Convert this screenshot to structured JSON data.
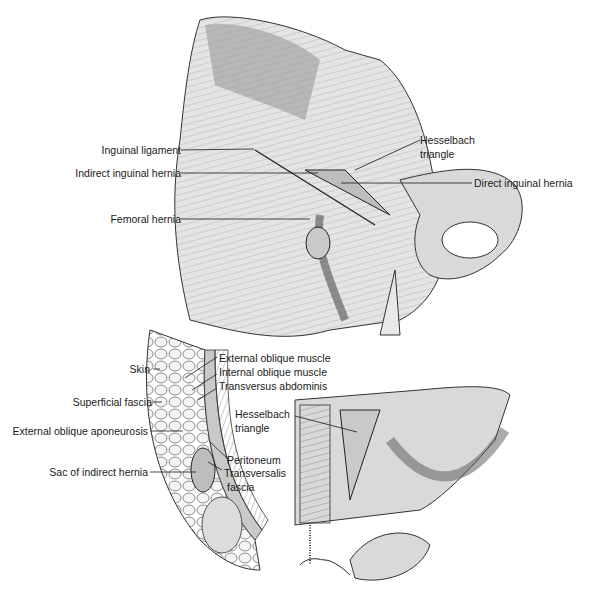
{
  "figure": {
    "top_panel": {
      "labels": {
        "inguinal_ligament": "Inguinal ligament",
        "indirect_inguinal_hernia": "Indirect inguinal hernia",
        "femoral_hernia": "Femoral hernia",
        "hesselbach_triangle_1": "Hesselbach",
        "hesselbach_triangle_2": "triangle",
        "direct_inguinal_hernia": "Direct inguinal hernia"
      }
    },
    "bottom_left_panel": {
      "labels": {
        "skin": "Skin",
        "superficial_fascia": "Superficial fascia",
        "external_oblique_aponeurosis": "External oblique aponeurosis",
        "sac_of_indirect_hernia": "Sac of indirect hernia",
        "external_oblique_muscle": "External oblique muscle",
        "internal_oblique_muscle": "Internal oblique muscle",
        "transversus_abdominis": "Transversus abdominis",
        "peritoneum": "Peritoneum",
        "transversalis_fascia_1": "Transversalis",
        "transversalis_fascia_2": "fascia"
      }
    },
    "bottom_right_panel": {
      "labels": {
        "hesselbach_triangle_1": "Hesselbach",
        "hesselbach_triangle_2": "triangle"
      }
    },
    "colors": {
      "ink": "#1a1a1a",
      "shade_light": "#e4e4e4",
      "shade_mid": "#c9c9c9",
      "shade_dark": "#9a9a9a"
    }
  }
}
